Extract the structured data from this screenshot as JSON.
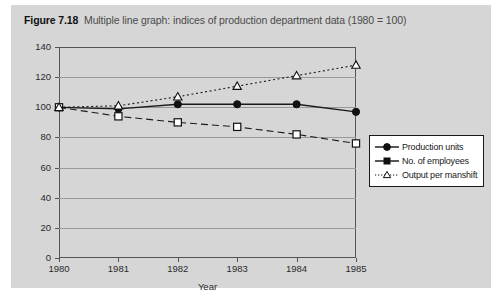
{
  "figure": {
    "label": "Figure 7.18",
    "caption": "Multiple line graph: indices of production department data (1980 = 100)"
  },
  "axis_title": {
    "x": "Year"
  },
  "legend": {
    "items": [
      {
        "label": "Production units",
        "marker": "filled-circle",
        "line": "solid"
      },
      {
        "label": "No. of employees",
        "marker": "filled-square",
        "line": "dashed"
      },
      {
        "label": "Output per manshift",
        "marker": "open-triangle",
        "line": "dotted"
      }
    ]
  },
  "colors": {
    "figure_background": "#d6d6d6",
    "plot_frame": "#555555",
    "gridline": "#9a9a9a",
    "series_line": "#1a1a1a",
    "legend_background": "#ffffff"
  },
  "chart_data": {
    "type": "line",
    "title": "Multiple line graph: indices of production department data (1980 = 100)",
    "xlabel": "Year",
    "ylabel": "",
    "categories": [
      "1980",
      "1981",
      "1982",
      "1983",
      "1984",
      "1985"
    ],
    "x": [
      1980,
      1981,
      1982,
      1983,
      1984,
      1985
    ],
    "xlim": [
      1980,
      1985
    ],
    "ylim": [
      0,
      140
    ],
    "yticks": [
      0,
      20,
      40,
      60,
      80,
      100,
      120,
      140
    ],
    "xticks": [
      "1980",
      "1981",
      "1982",
      "1983",
      "1984",
      "1985"
    ],
    "grid": true,
    "legend_position": "right-outside",
    "series": [
      {
        "name": "Production units",
        "marker": "filled-circle",
        "linestyle": "solid",
        "values": [
          100,
          99,
          102,
          102,
          102,
          97
        ]
      },
      {
        "name": "No. of employees",
        "marker": "open-square",
        "linestyle": "dashed",
        "values": [
          100,
          94,
          90,
          87,
          82,
          76
        ]
      },
      {
        "name": "Output per manshift",
        "marker": "open-triangle",
        "linestyle": "dotted",
        "values": [
          100,
          101,
          107,
          114,
          121,
          128
        ]
      }
    ]
  }
}
